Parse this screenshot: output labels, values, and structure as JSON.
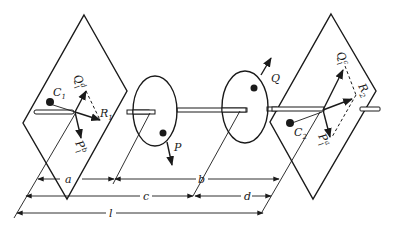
{
  "diagram": {
    "colors": {
      "ink": "#1a1a1a",
      "background": "#ffffff"
    },
    "left_plane": {
      "mass_label": "C",
      "mass_sub": "1",
      "q_label": "Q",
      "q_frac_num": "d",
      "q_frac_den": "l",
      "p_label": "P",
      "p_frac_num": "b",
      "p_frac_den": "l",
      "resultant_label": "R",
      "resultant_sub": "1"
    },
    "right_plane": {
      "mass_label": "C",
      "mass_sub": "2",
      "q_label": "Q",
      "q_frac_num": "c",
      "q_frac_den": "l",
      "p_label": "P",
      "p_frac_num": "a",
      "p_frac_den": "l",
      "resultant_label": "R",
      "resultant_sub": "2"
    },
    "disc_left": {
      "force_label": "P"
    },
    "disc_right": {
      "force_label": "Q"
    },
    "dimensions": {
      "a": "a",
      "b": "b",
      "c": "c",
      "d": "d",
      "l": "l"
    }
  }
}
